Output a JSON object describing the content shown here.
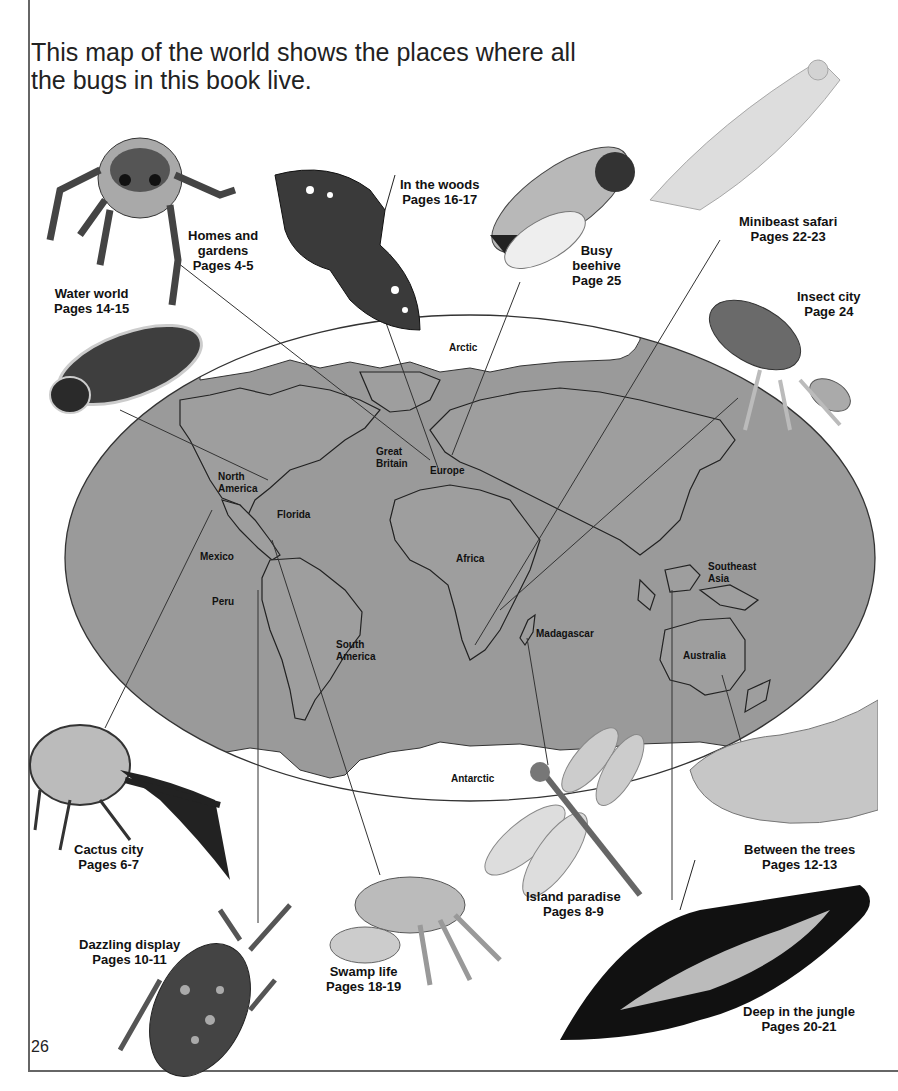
{
  "intro": {
    "line1": "This map of the world shows the places where all",
    "line2": "the bugs in this book live."
  },
  "map": {
    "ocean_color": "#9a9a9a",
    "ice_color": "#ffffff",
    "regions": {
      "arctic": "Arctic",
      "antarctic": "Antarctic",
      "north_america": [
        "North",
        "America"
      ],
      "great_britain": [
        "Great",
        "Britain"
      ],
      "europe": "Europe",
      "florida": "Florida",
      "mexico": "Mexico",
      "peru": "Peru",
      "africa": "Africa",
      "south_america": [
        "South",
        "America"
      ],
      "madagascar": "Madagascar",
      "southeast_asia": [
        "Southeast",
        "Asia"
      ],
      "australia": "Australia"
    }
  },
  "habitats": [
    {
      "id": "homes-and-gardens",
      "lines": [
        "Homes and",
        "gardens",
        "Pages 4-5"
      ],
      "bug": "jumping-spider"
    },
    {
      "id": "in-the-woods",
      "lines": [
        "In the woods",
        "Pages 16-17"
      ],
      "bug": "purple-emperor-butterfly"
    },
    {
      "id": "busy-beehive",
      "lines": [
        "Busy",
        "beehive",
        "Page 25"
      ],
      "bug": "honeybee"
    },
    {
      "id": "minibeast-safari",
      "lines": [
        "Minibeast safari",
        "Pages 22-23"
      ],
      "bug": "orchid-mantis"
    },
    {
      "id": "water-world",
      "lines": [
        "Water world",
        "Pages 14-15"
      ],
      "bug": "diving-beetle"
    },
    {
      "id": "insect-city",
      "lines": [
        "Insect city",
        "Page 24"
      ],
      "bug": "termite"
    },
    {
      "id": "cactus-city",
      "lines": [
        "Cactus city",
        "Pages 6-7"
      ],
      "bug": "hercules-beetle"
    },
    {
      "id": "between-the-trees",
      "lines": [
        "Between the trees",
        "Pages 12-13"
      ],
      "bug": "caterpillar"
    },
    {
      "id": "island-paradise",
      "lines": [
        "Island paradise",
        "Pages 8-9"
      ],
      "bug": "dragonfly"
    },
    {
      "id": "dazzling-display",
      "lines": [
        "Dazzling display",
        "Pages 10-11"
      ],
      "bug": "assassin-bug"
    },
    {
      "id": "swamp-life",
      "lines": [
        "Swamp life",
        "Pages 18-19"
      ],
      "bug": "fiddler-crab"
    },
    {
      "id": "deep-in-the-jungle",
      "lines": [
        "Deep in the jungle",
        "Pages 20-21"
      ],
      "bug": "birdwing-butterfly"
    }
  ],
  "page_number": "26"
}
